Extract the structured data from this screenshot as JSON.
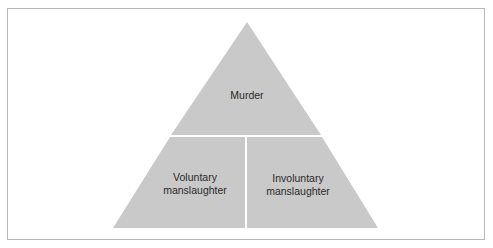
{
  "diagram": {
    "type": "pyramid",
    "colors": {
      "fill": "#c9c9c9",
      "divider": "#ffffff",
      "border": "#b8b8b8",
      "text": "#2a2a2a"
    },
    "top": {
      "label": "Murder"
    },
    "bottom_left": {
      "label_line1": "Voluntary",
      "label_line2": "manslaughter"
    },
    "bottom_right": {
      "label_line1": "Involuntary",
      "label_line2": "manslaughter"
    }
  }
}
